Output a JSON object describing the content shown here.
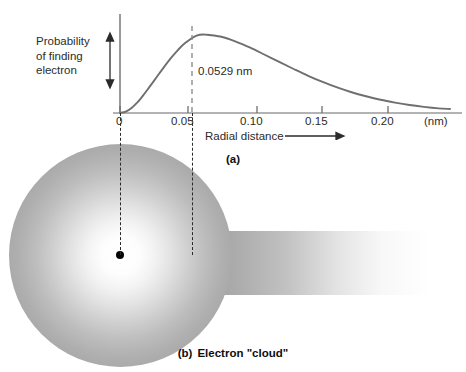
{
  "figure": {
    "panel_a_caption": "(a)",
    "panel_b_caption_tag": "(b)",
    "panel_b_caption_text": "Electron \"cloud\""
  },
  "chart_data": {
    "type": "line",
    "title": "",
    "xlabel": "Radial distance",
    "ylabel": "Probability of finding electron",
    "ylabel_lines": [
      "Probability",
      "of finding",
      "electron"
    ],
    "x_unit": "(nm)",
    "xticks": [
      0,
      0.05,
      0.1,
      0.15,
      0.2
    ],
    "xtick_labels": [
      "0",
      "0.05",
      "0.10",
      "0.15",
      "0.20"
    ],
    "xlim": [
      0,
      0.228
    ],
    "ylim": [
      0,
      1.0
    ],
    "yticks": [],
    "ytick_labels": [],
    "grid": false,
    "legend": false,
    "annotations": [
      {
        "name": "bohr-radius",
        "label": "0.0529 nm",
        "x": 0.0529,
        "type": "vertical-dashed-line-at-peak"
      }
    ],
    "series": [
      {
        "name": "Radial probability density (hydrogen 1s)",
        "color": "#6f6f6f",
        "x": [
          0.0,
          0.004,
          0.008,
          0.012,
          0.016,
          0.02,
          0.025,
          0.03,
          0.035,
          0.04,
          0.045,
          0.0529,
          0.06,
          0.07,
          0.08,
          0.09,
          0.1,
          0.11,
          0.12,
          0.13,
          0.14,
          0.15,
          0.16,
          0.17,
          0.18,
          0.19,
          0.2,
          0.21,
          0.22,
          0.228
        ],
        "y": [
          0.0,
          0.016,
          0.058,
          0.12,
          0.2,
          0.288,
          0.4,
          0.513,
          0.62,
          0.715,
          0.795,
          0.88,
          0.89,
          0.866,
          0.812,
          0.742,
          0.662,
          0.58,
          0.5,
          0.423,
          0.353,
          0.29,
          0.236,
          0.19,
          0.15,
          0.118,
          0.091,
          0.07,
          0.053,
          0.045
        ]
      }
    ]
  },
  "cloud": {
    "nucleus_name": "nucleus",
    "sphere_name": "electron-probability-cloud",
    "band_name": "probability-tail-band",
    "sphere_edge_color": "#9b9b9b",
    "sphere_center_color": "#ffffff",
    "nucleus_color": "#050505"
  }
}
